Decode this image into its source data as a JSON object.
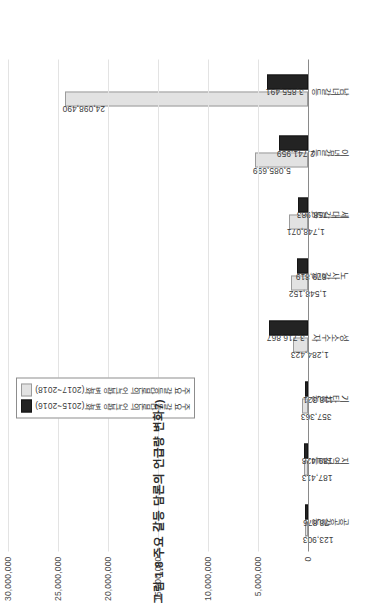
{
  "figure": {
    "title": "그림 1.8 주요 갈등 담론의 언급량 변화7)",
    "axis_max_label": "30,000,000",
    "axis_min_label": "0"
  },
  "legend": {
    "position": "top-left",
    "items": [
      {
        "label": "주요 갈등담론의 언급량 변화(2017~2018)",
        "color": "#e2e2e2"
      },
      {
        "label": "주요 갈등담론의 언급량 변화(2015~2016)",
        "color": "#232323"
      }
    ]
  },
  "chart_data": {
    "type": "bar",
    "title": "그림 1.8 주요 갈등 담론의 언급량 변화7)",
    "xlabel": "",
    "ylabel": "",
    "orientation": "vertical",
    "grid": true,
    "legend_position": "top-left",
    "ylim": [
      0,
      30000000
    ],
    "yticks": [
      0,
      5000000,
      10000000,
      15000000,
      20000000,
      25000000,
      30000000
    ],
    "ytick_labels": [
      "0",
      "5,000,000",
      "10,000,000",
      "15,000,000",
      "20,000,000",
      "25,000,000",
      "30,000,000"
    ],
    "categories": [
      "공공갈등",
      "지역갈등",
      "기타갈등",
      "성소수자",
      "노사갈등",
      "세대갈등",
      "이념갈등",
      "남녀갈등"
    ],
    "series": [
      {
        "name": "주요 갈등담론의 언급량 변화(2017~2018)",
        "color": "#e2e2e2",
        "values": [
          123903,
          187413,
          357363,
          1284423,
          1548152,
          1748071,
          5085699,
          24098490
        ],
        "labels": [
          "123,903",
          "187,413",
          "357,363",
          "1,284,423",
          "1,548,152",
          "1,748,071",
          "5,085,699",
          "24,098,490"
        ]
      },
      {
        "name": "주요 갈등담론의 언급량 변화(2015~2016)",
        "color": "#232323",
        "values": [
          78876,
          189428,
          118321,
          3716867,
          879819,
          758983,
          2741959,
          3855491
        ],
        "labels": [
          "78,876",
          "189,428",
          "118,321",
          "3,716,867",
          "879,819",
          "758,983",
          "2,741,959",
          "3,855,491"
        ]
      }
    ]
  }
}
